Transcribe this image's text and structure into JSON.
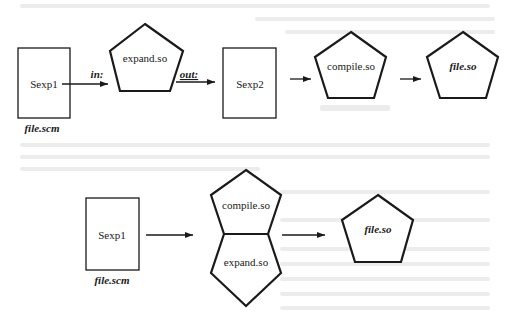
{
  "figure": {
    "top_row": {
      "source_box": {
        "label": "Sexp1",
        "caption": "file.scm"
      },
      "in_arrow": {
        "label": "in:"
      },
      "expander": {
        "label": "expand.so"
      },
      "out_arrow": {
        "label": "out:"
      },
      "result_box": {
        "label": "Sexp2"
      },
      "compiler": {
        "label": "compile.so"
      },
      "output": {
        "label": "file.so"
      }
    },
    "bottom_row": {
      "source_box": {
        "label": "Sexp1",
        "caption": "file.scm"
      },
      "compiler": {
        "label": "compile.so"
      },
      "expander": {
        "label": "expand.so"
      },
      "output": {
        "label": "file.so"
      }
    }
  },
  "colors": {
    "ink": "#1a1a1a",
    "paper": "#ffffff",
    "bleed_through": "#ececec"
  }
}
